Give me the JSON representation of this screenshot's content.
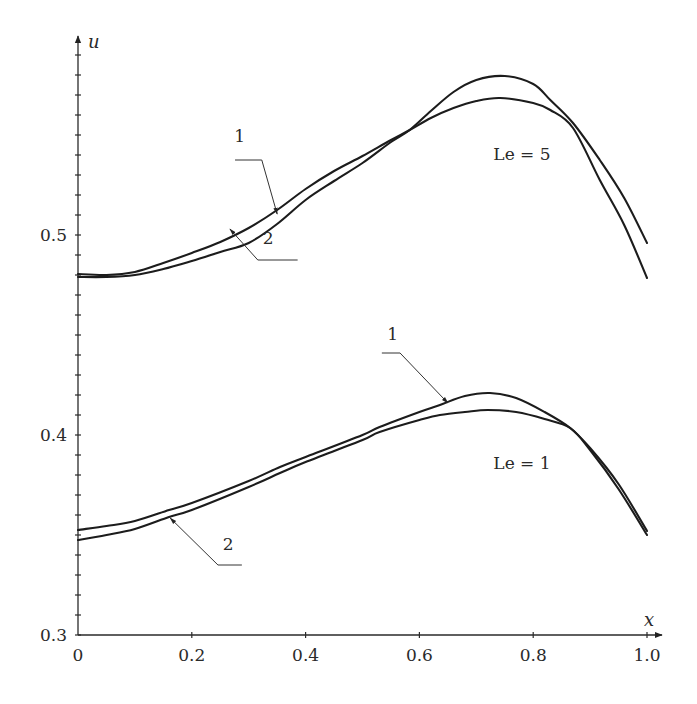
{
  "chart_data": {
    "type": "line",
    "title": "",
    "xlabel": "x",
    "ylabel": "u",
    "xlim": [
      0,
      1.0
    ],
    "ylim": [
      0.3,
      0.6
    ],
    "grid": false,
    "legend": "none (curves labeled inline with leader lines)",
    "x_ticks": [
      "0",
      "0.2",
      "0.4",
      "0.6",
      "0.8",
      "1.0"
    ],
    "y_ticks": [
      "0.3",
      "0.4",
      "0.5"
    ],
    "y_minor_step": 0.01,
    "annotations": [
      {
        "text": "Le = 5",
        "x": 0.73,
        "u": 0.5375
      },
      {
        "text": "Le = 1",
        "x": 0.73,
        "u": 0.383
      }
    ],
    "groups": [
      {
        "name": "Le = 5",
        "series": [
          {
            "name": "1",
            "x": [
              0,
              0.05,
              0.1,
              0.15,
              0.2,
              0.25,
              0.3,
              0.35,
              0.4,
              0.45,
              0.5,
              0.55,
              0.583,
              0.62,
              0.66,
              0.7,
              0.75,
              0.8,
              0.83,
              0.87,
              0.917,
              0.96,
              1.0
            ],
            "u": [
              0.479,
              0.479,
              0.48,
              0.483,
              0.487,
              0.4915,
              0.496,
              0.5055,
              0.5175,
              0.527,
              0.536,
              0.5465,
              0.5525,
              0.562,
              0.5715,
              0.5775,
              0.5795,
              0.5755,
              0.5675,
              0.556,
              0.5375,
              0.5185,
              0.496
            ]
          },
          {
            "name": "2",
            "x": [
              0,
              0.05,
              0.1,
              0.15,
              0.2,
              0.25,
              0.3,
              0.35,
              0.4,
              0.45,
              0.5,
              0.55,
              0.583,
              0.62,
              0.66,
              0.7,
              0.742,
              0.8,
              0.83,
              0.87,
              0.917,
              0.96,
              1.0
            ],
            "u": [
              0.4805,
              0.48,
              0.4815,
              0.486,
              0.491,
              0.4965,
              0.5035,
              0.5125,
              0.523,
              0.532,
              0.5395,
              0.5475,
              0.5525,
              0.5585,
              0.5635,
              0.567,
              0.5685,
              0.566,
              0.5625,
              0.5535,
              0.5275,
              0.505,
              0.4785
            ]
          }
        ],
        "labels": [
          {
            "text": "1",
            "text_x": 0.284,
            "text_u": 0.5465,
            "underline": [
              [
                0.276,
                0.5375
              ],
              [
                0.323,
                0.5375
              ]
            ],
            "arrow_to": [
              0.35,
              0.5105
            ]
          },
          {
            "text": "2",
            "text_x": 0.334,
            "text_u": 0.4955,
            "underline": [
              [
                0.316,
                0.4875
              ],
              [
                0.386,
                0.4875
              ]
            ],
            "arrow_to": [
              0.267,
              0.503
            ]
          }
        ]
      },
      {
        "name": "Le = 1",
        "series": [
          {
            "name": "1",
            "x": [
              0,
              0.05,
              0.1,
              0.16,
              0.2,
              0.3,
              0.355,
              0.4,
              0.5,
              0.53,
              0.6,
              0.636,
              0.68,
              0.724,
              0.77,
              0.82,
              0.865,
              0.9,
              0.95,
              1.0
            ],
            "u": [
              0.3525,
              0.3545,
              0.357,
              0.3625,
              0.366,
              0.377,
              0.384,
              0.389,
              0.4,
              0.404,
              0.4115,
              0.415,
              0.4195,
              0.421,
              0.4185,
              0.4115,
              0.4035,
              0.3935,
              0.3755,
              0.352
            ]
          },
          {
            "name": "2",
            "x": [
              0,
              0.05,
              0.1,
              0.16,
              0.2,
              0.3,
              0.355,
              0.4,
              0.5,
              0.53,
              0.6,
              0.636,
              0.68,
              0.72,
              0.77,
              0.82,
              0.865,
              0.9,
              0.95,
              1.0
            ],
            "u": [
              0.3475,
              0.35,
              0.353,
              0.359,
              0.3625,
              0.374,
              0.381,
              0.3865,
              0.3975,
              0.4015,
              0.4075,
              0.41,
              0.4115,
              0.4125,
              0.4115,
              0.408,
              0.4035,
              0.3925,
              0.373,
              0.35
            ]
          }
        ],
        "labels": [
          {
            "text": "1",
            "text_x": 0.553,
            "text_u": 0.4475,
            "underline": [
              [
                0.534,
                0.441
              ],
              [
                0.566,
                0.441
              ]
            ],
            "arrow_to": [
              0.65,
              0.416
            ]
          },
          {
            "text": "2",
            "text_x": 0.264,
            "text_u": 0.3425,
            "underline": [
              [
                0.246,
                0.335
              ],
              [
                0.288,
                0.335
              ]
            ],
            "arrow_to": [
              0.162,
              0.3585
            ]
          }
        ]
      }
    ]
  },
  "axes": {
    "x_label": "x",
    "y_label": "u",
    "x_tick_labels": [
      "0",
      "0.2",
      "0.4",
      "0.6",
      "0.8",
      "1.0"
    ],
    "y_tick_labels": [
      "0.3",
      "0.4",
      "0.5"
    ]
  }
}
